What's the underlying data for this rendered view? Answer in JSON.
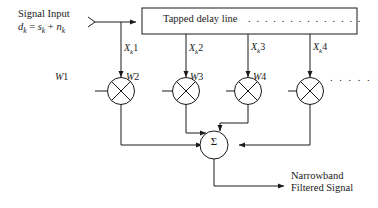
{
  "figure": {
    "type": "block-diagram",
    "background_color": "#ffffff",
    "line_color": "#1a1a1a"
  },
  "input": {
    "label": "Signal Input",
    "equation_parts": {
      "d": "d",
      "d_sub": "k",
      "equals": " = ",
      "s": "s",
      "s_sub": "k",
      "plus": " + ",
      "n": "n",
      "n_sub": "k"
    },
    "equation_plain": "dk = sk + nk",
    "arrow_marker": "chevron-right"
  },
  "delay_line": {
    "text": "Tapped delay line",
    "continuation_dots": ". . . . . . . . . . . . . .",
    "border_color": "#1a1a1a"
  },
  "taps": [
    {
      "symbol": "X",
      "sub": "k",
      "index": "1"
    },
    {
      "symbol": "X",
      "sub": "k",
      "index": "2"
    },
    {
      "symbol": "X",
      "sub": "k",
      "index": "3"
    },
    {
      "symbol": "X",
      "sub": "k",
      "index": "4"
    }
  ],
  "weights": [
    {
      "symbol": "W",
      "index": "1"
    },
    {
      "symbol": "W",
      "index": "2"
    },
    {
      "symbol": "W",
      "index": "3"
    },
    {
      "symbol": "W",
      "index": "4"
    }
  ],
  "multipliers": {
    "glyph": "cross-in-circle",
    "count": 4,
    "trailing_dots": ". . . . ."
  },
  "summer": {
    "glyph": "Σ",
    "name": "summation-node"
  },
  "output": {
    "line1": "Narrowband",
    "line2": "Filtered Signal"
  }
}
